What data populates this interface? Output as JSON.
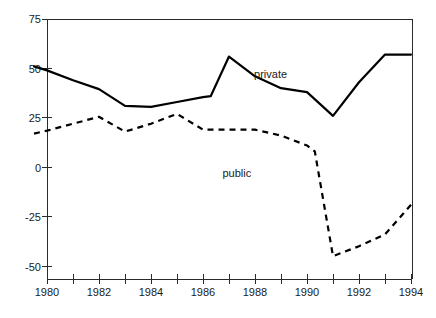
{
  "chart_data": {
    "type": "line",
    "title": "",
    "subtitle": "",
    "xlabel": "",
    "ylabel": "",
    "xlim": [
      1979.5,
      1994
    ],
    "ylim": [
      -57,
      75
    ],
    "grid": false,
    "legend_position": "inline-annotation",
    "y_ticks": [
      75,
      50,
      25,
      0,
      -25,
      -50
    ],
    "y_tick_labels": [
      "75",
      "50",
      "25",
      "0",
      "-25",
      "-50"
    ],
    "x_ticks": [
      1980,
      1981,
      1982,
      1983,
      1984,
      1985,
      1986,
      1987,
      1988,
      1989,
      1990,
      1991,
      1992,
      1993,
      1994
    ],
    "x_tick_labels": [
      "1980",
      "",
      "1982",
      "",
      "1984",
      "",
      "1986",
      "",
      "1988",
      "",
      "1990",
      "",
      "1992",
      "",
      "1994"
    ],
    "x_labeled_ticks": [
      "1980",
      "1982",
      "1984",
      "1986",
      "1988",
      "1990",
      "1992",
      "1994"
    ],
    "series": [
      {
        "name": "private",
        "style": "solid",
        "color": "#000000",
        "label_position": {
          "x": 1988.6,
          "y": 45
        },
        "x": [
          1979.5,
          1980,
          1981,
          1982,
          1983,
          1984,
          1985,
          1986,
          1986.3,
          1987,
          1988,
          1989,
          1990,
          1991,
          1992,
          1993,
          1994
        ],
        "values": [
          51,
          49,
          44,
          39.5,
          31,
          30.5,
          33,
          35.5,
          36,
          56,
          46,
          40,
          38,
          26,
          43,
          57,
          57
        ]
      },
      {
        "name": "public",
        "style": "dashed",
        "color": "#000000",
        "label_position": {
          "x": 1987.3,
          "y": -5
        },
        "x": [
          1979.5,
          1980,
          1981,
          1982,
          1983,
          1984,
          1985,
          1986,
          1987,
          1988,
          1989,
          1990,
          1990.3,
          1991,
          1992,
          1993,
          1994
        ],
        "values": [
          17,
          18.5,
          22,
          25.5,
          18,
          22,
          27,
          19,
          19,
          19,
          16,
          11,
          8,
          -45,
          -40,
          -34,
          -19
        ]
      }
    ]
  },
  "labels": {
    "private": "private",
    "public": "public",
    "y_75": "75",
    "y_50": "50",
    "y_25": "25",
    "y_0": "0",
    "y_neg25": "-25",
    "y_neg50": "-50",
    "x_1980": "1980",
    "x_1982": "1982",
    "x_1984": "1984",
    "x_1986": "1986",
    "x_1988": "1988",
    "x_1990": "1990",
    "x_1992": "1992",
    "x_1994": "1994"
  },
  "colors": {
    "axis": "#2b2b2b",
    "line": "#000000",
    "background": "#ffffff",
    "text": "#1a1a1a"
  }
}
